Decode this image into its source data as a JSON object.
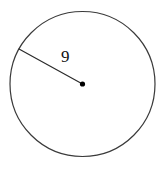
{
  "figure": {
    "type": "geometry-diagram",
    "shape_name": "circle",
    "background_color": "#ffffff",
    "stroke_color": "#3a3a3a",
    "label_color": "#111111",
    "center_dot_color": "#000000",
    "canvas": {
      "width": 165,
      "height": 169
    },
    "circle": {
      "center_x": 82.5,
      "center_y": 84,
      "radius_px": 72.5,
      "stroke_width": 1.2
    },
    "center_point": {
      "x": 82.5,
      "y": 84,
      "dot_radius_px": 2.6
    },
    "radius_segment": {
      "from_x": 19,
      "from_y": 49,
      "to_x": 82.5,
      "to_y": 84,
      "stroke_width": 1.2,
      "label": "9",
      "label_x": 61,
      "label_y": 48
    }
  }
}
